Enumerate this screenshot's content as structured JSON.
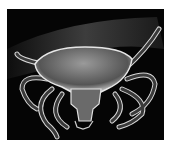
{
  "image": {
    "subject": "scanning electron micrograph of a tick",
    "colors": {
      "background": "#050505",
      "highlight": "#e8e8e8",
      "midtone": "#8a8a8a",
      "page": "#ffffff"
    }
  }
}
